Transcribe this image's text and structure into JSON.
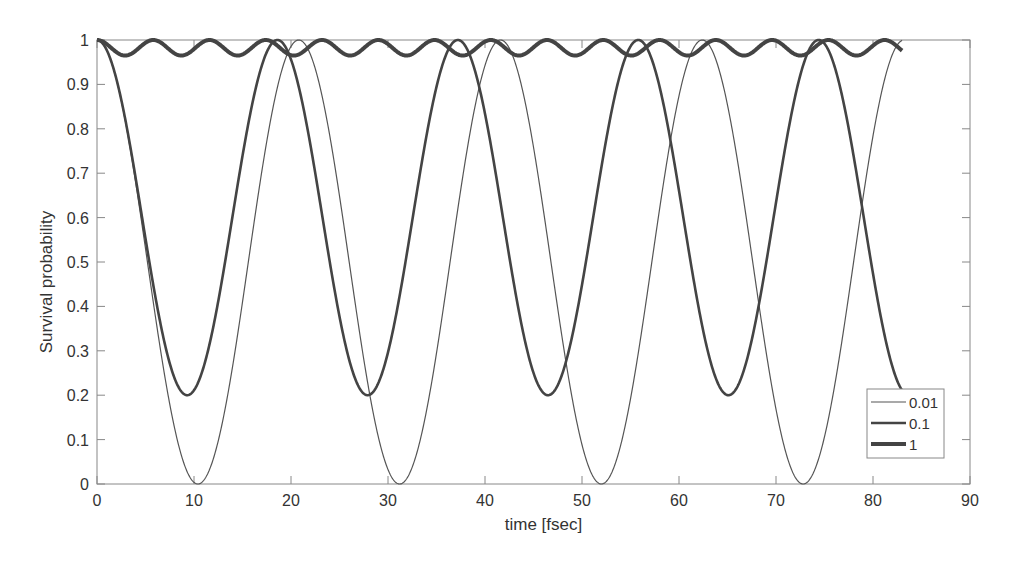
{
  "chart_data": {
    "type": "line",
    "title": "",
    "xlabel": "time [fsec]",
    "ylabel": "Survival probability",
    "xlim": [
      0,
      90
    ],
    "ylim": [
      0,
      1
    ],
    "xticks": [
      0,
      10,
      20,
      30,
      40,
      50,
      60,
      70,
      80,
      90
    ],
    "yticks": [
      0,
      0.1,
      0.2,
      0.3,
      0.4,
      0.5,
      0.6,
      0.7,
      0.8,
      0.9,
      1
    ],
    "xtick_labels": [
      "0",
      "10",
      "20",
      "30",
      "40",
      "50",
      "60",
      "70",
      "80",
      "90"
    ],
    "ytick_labels": [
      "0",
      "0.1",
      "0.2",
      "0.3",
      "0.4",
      "0.5",
      "0.6",
      "0.7",
      "0.8",
      "0.9",
      "1"
    ],
    "grid": false,
    "legend_position": "lower right",
    "x_range_data": [
      0,
      83
    ],
    "series": [
      {
        "name": "0.01",
        "line_width": 1.2,
        "color": "#555555",
        "period": 20.8,
        "min": 0.0,
        "minima_at": [
          10.4,
          31.2,
          52.0,
          72.8
        ],
        "end_value": 1.0
      },
      {
        "name": "0.1",
        "line_width": 2.6,
        "color": "#444444",
        "period": 18.6,
        "min": 0.2,
        "minima_at": [
          9.1,
          27.7,
          46.4,
          65.0
        ],
        "end_value": 0.22
      },
      {
        "name": "1",
        "line_width": 4.0,
        "color": "#444444",
        "period": 5.8,
        "min": 0.965,
        "minima_at": [
          2.9,
          8.7,
          14.5,
          20.3,
          26.1,
          31.9,
          37.7,
          43.5,
          49.3,
          55.1,
          60.9,
          66.7,
          72.5,
          78.3
        ],
        "end_value": 0.985
      }
    ]
  },
  "legend": {
    "items": [
      "0.01",
      "0.1",
      "1"
    ]
  }
}
